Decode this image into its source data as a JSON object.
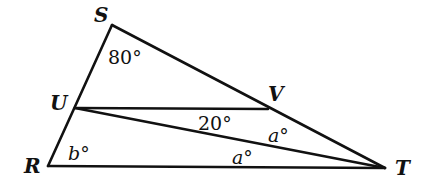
{
  "diagram": {
    "type": "geometry-triangle",
    "vertices": {
      "S": {
        "label": "S",
        "x": 112,
        "y": 25
      },
      "U": {
        "label": "U",
        "x": 75,
        "y": 108
      },
      "R": {
        "label": "R",
        "x": 48,
        "y": 166
      },
      "V": {
        "label": "V",
        "x": 268,
        "y": 109
      },
      "T": {
        "label": "T",
        "x": 385,
        "y": 168
      }
    },
    "segments": [
      [
        "S",
        "R"
      ],
      [
        "S",
        "T"
      ],
      [
        "R",
        "T"
      ],
      [
        "U",
        "V"
      ],
      [
        "U",
        "T"
      ]
    ],
    "angles": {
      "S": "80°",
      "UVlower": "20°",
      "VTU": "a°",
      "UTR": "a°",
      "R": "b°"
    }
  }
}
